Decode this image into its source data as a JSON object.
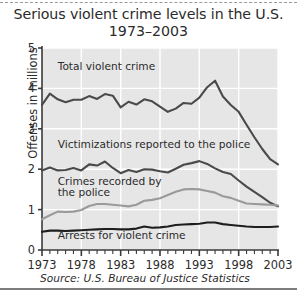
{
  "figure": {
    "title_line1": "Serious violent crime levels in the U.S.",
    "title_line2": "1973–2003",
    "ylabel": "Offenses in millions",
    "source": "Source: U.S. Bureau of Justice Statistics",
    "colors": {
      "plot_background": "#e6e6e6",
      "gridline": "#ffffff",
      "axis": "#3a3a3a",
      "text": "#2b2b2b",
      "series_dark": "#4a4a4a",
      "series_black": "#1e1e1e",
      "series_gray": "#9a9a9a",
      "page_background": "#ffffff"
    }
  },
  "chart_data": {
    "type": "line",
    "title": "Serious violent crime levels in the U.S. 1973–2003",
    "subtitle": "1973–2003",
    "xlabel": "",
    "ylabel": "Offenses in millions",
    "xlim": [
      1973,
      2003
    ],
    "ylim": [
      0,
      5
    ],
    "xticks": [
      1973,
      1978,
      1983,
      1988,
      1993,
      1998,
      2003
    ],
    "xticklabels": [
      "1973",
      "1978",
      "1983",
      "1988",
      "1993",
      "1998",
      "2003"
    ],
    "yticks": [
      0,
      1,
      2,
      3,
      4,
      5
    ],
    "yticklabels": [
      "0",
      "1",
      "2",
      "3",
      "4",
      "5"
    ],
    "minor_xtick_interval": 1,
    "grid": true,
    "grid_color": "#ffffff",
    "legend": "inline-annotations",
    "x": [
      1973,
      1974,
      1975,
      1976,
      1977,
      1978,
      1979,
      1980,
      1981,
      1982,
      1983,
      1984,
      1985,
      1986,
      1987,
      1988,
      1989,
      1990,
      1991,
      1992,
      1993,
      1994,
      1995,
      1996,
      1997,
      1998,
      1999,
      2000,
      2001,
      2002,
      2003
    ],
    "series": [
      {
        "name": "Total violent crime",
        "color": "#4a4a4a",
        "width": 2.1,
        "label_x": 1975.0,
        "label_y": 4.45,
        "values": [
          3.59,
          3.87,
          3.73,
          3.66,
          3.72,
          3.72,
          3.81,
          3.74,
          3.86,
          3.82,
          3.53,
          3.67,
          3.6,
          3.73,
          3.68,
          3.55,
          3.42,
          3.5,
          3.64,
          3.62,
          3.77,
          4.03,
          4.19,
          3.8,
          3.59,
          3.42,
          3.1,
          2.79,
          2.5,
          2.25,
          2.12
        ]
      },
      {
        "name": "Victimizations reported to the police",
        "color": "#4a4a4a",
        "width": 2.1,
        "label_x": 1975.0,
        "label_y": 2.53,
        "values": [
          1.97,
          2.04,
          1.97,
          1.98,
          2.03,
          1.97,
          2.12,
          2.09,
          2.19,
          2.03,
          1.9,
          1.98,
          1.93,
          2.0,
          1.99,
          1.95,
          1.92,
          2.01,
          2.11,
          2.15,
          2.2,
          2.13,
          2.02,
          1.93,
          1.88,
          1.72,
          1.57,
          1.44,
          1.31,
          1.17,
          1.08
        ]
      },
      {
        "name": "Crimes recorded by the police",
        "color": "#9a9a9a",
        "width": 2.1,
        "label_x": 1975.0,
        "label_y": 1.62,
        "values": [
          0.76,
          0.86,
          0.95,
          0.94,
          0.95,
          0.99,
          1.09,
          1.14,
          1.14,
          1.12,
          1.1,
          1.08,
          1.12,
          1.22,
          1.24,
          1.28,
          1.36,
          1.44,
          1.5,
          1.51,
          1.5,
          1.46,
          1.42,
          1.33,
          1.29,
          1.22,
          1.15,
          1.14,
          1.13,
          1.12,
          1.1
        ]
      },
      {
        "name": "Arrests for violent crime",
        "color": "#1e1e1e",
        "width": 2.1,
        "label_x": 1975.0,
        "label_y": 0.28,
        "values": [
          0.45,
          0.48,
          0.48,
          0.47,
          0.48,
          0.49,
          0.5,
          0.51,
          0.52,
          0.52,
          0.51,
          0.51,
          0.53,
          0.58,
          0.55,
          0.56,
          0.58,
          0.62,
          0.63,
          0.64,
          0.65,
          0.68,
          0.68,
          0.64,
          0.62,
          0.6,
          0.58,
          0.57,
          0.57,
          0.57,
          0.58
        ]
      }
    ]
  }
}
